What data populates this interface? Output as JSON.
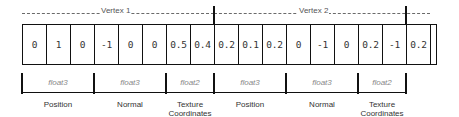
{
  "header": {
    "vertex_labels": [
      "Vertex 1",
      "Vertex 2"
    ]
  },
  "cells": [
    "0",
    "1",
    "0",
    "-1",
    "0",
    "0",
    "0.5",
    "0.4",
    "0.2",
    "0.1",
    "0.2",
    "0",
    "-1",
    "0",
    "0.2",
    "-1",
    "0.2",
    ""
  ],
  "attributes": [
    {
      "type": "float3",
      "name": "Position"
    },
    {
      "type": "float3",
      "name": "Normal"
    },
    {
      "type": "float2",
      "name": "Texture Coordinates"
    },
    {
      "type": "float3",
      "name": "Position"
    },
    {
      "type": "float3",
      "name": "Normal"
    },
    {
      "type": "float2",
      "name": "Texture Coordinates"
    }
  ],
  "colors": {
    "line": "#111111",
    "dash": "#6a6a6a",
    "type_text": "#888888",
    "label_text": "#333333"
  }
}
